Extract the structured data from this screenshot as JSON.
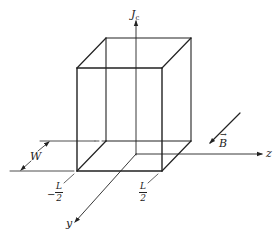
{
  "diagram": {
    "labels": {
      "vertical_axis": "J",
      "vertical_axis_subscript": "c",
      "z_axis": "z",
      "y_axis": "y",
      "field": "B",
      "width": "W",
      "left_bound_sign": "−",
      "left_bound_num": "L",
      "left_bound_den": "2",
      "right_bound_num": "L",
      "right_bound_den": "2"
    },
    "colors": {
      "stroke": "#222222",
      "background": "#ffffff"
    }
  }
}
